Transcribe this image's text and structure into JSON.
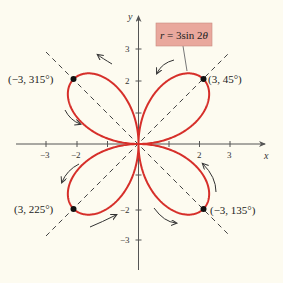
{
  "figure": {
    "equation": {
      "r": "r",
      "equals": " = 3sin 2",
      "theta": "θ"
    },
    "axes": {
      "x_label": "x",
      "y_label": "y"
    },
    "x_ticks": [
      {
        "value": -3,
        "label": "−3"
      },
      {
        "value": -2,
        "label": "−2"
      },
      {
        "value": -1,
        "label": ""
      },
      {
        "value": 1,
        "label": ""
      },
      {
        "value": 2,
        "label": "2"
      },
      {
        "value": 3,
        "label": "3"
      }
    ],
    "y_ticks": [
      {
        "value": 3,
        "label": "3"
      },
      {
        "value": 2,
        "label": "2"
      },
      {
        "value": 1,
        "label": ""
      },
      {
        "value": -1,
        "label": ""
      },
      {
        "value": -2,
        "label": "−2"
      },
      {
        "value": -3,
        "label": "−3"
      }
    ],
    "points": [
      {
        "label": "(3, 45°)"
      },
      {
        "label": "(−3, 315°)"
      },
      {
        "label": "(3, 225°)"
      },
      {
        "label": "(−3, 135°)"
      }
    ],
    "colors": {
      "curve": "#d62f2a",
      "label_box": "#e9a89d",
      "background": "#fdfbf0",
      "axis": "#555555"
    }
  },
  "chart_data": {
    "type": "line",
    "xlabel": "x",
    "ylabel": "y",
    "xlim": [
      -3.5,
      3.5
    ],
    "ylim": [
      -3.5,
      3.5
    ],
    "grid": false,
    "curve": "polar rose r = 3 sin 2θ (four petals)",
    "marked_points": [
      {
        "polar": "(3, 45°)",
        "x": 2.12,
        "y": 2.12
      },
      {
        "polar": "(−3, 315°)",
        "x": -2.12,
        "y": 2.12
      },
      {
        "polar": "(3, 225°)",
        "x": -2.12,
        "y": -2.12
      },
      {
        "polar": "(−3, 135°)",
        "x": 2.12,
        "y": -2.12
      }
    ],
    "guide_lines": [
      "y = x (dashed)",
      "y = −x (dashed)"
    ]
  }
}
